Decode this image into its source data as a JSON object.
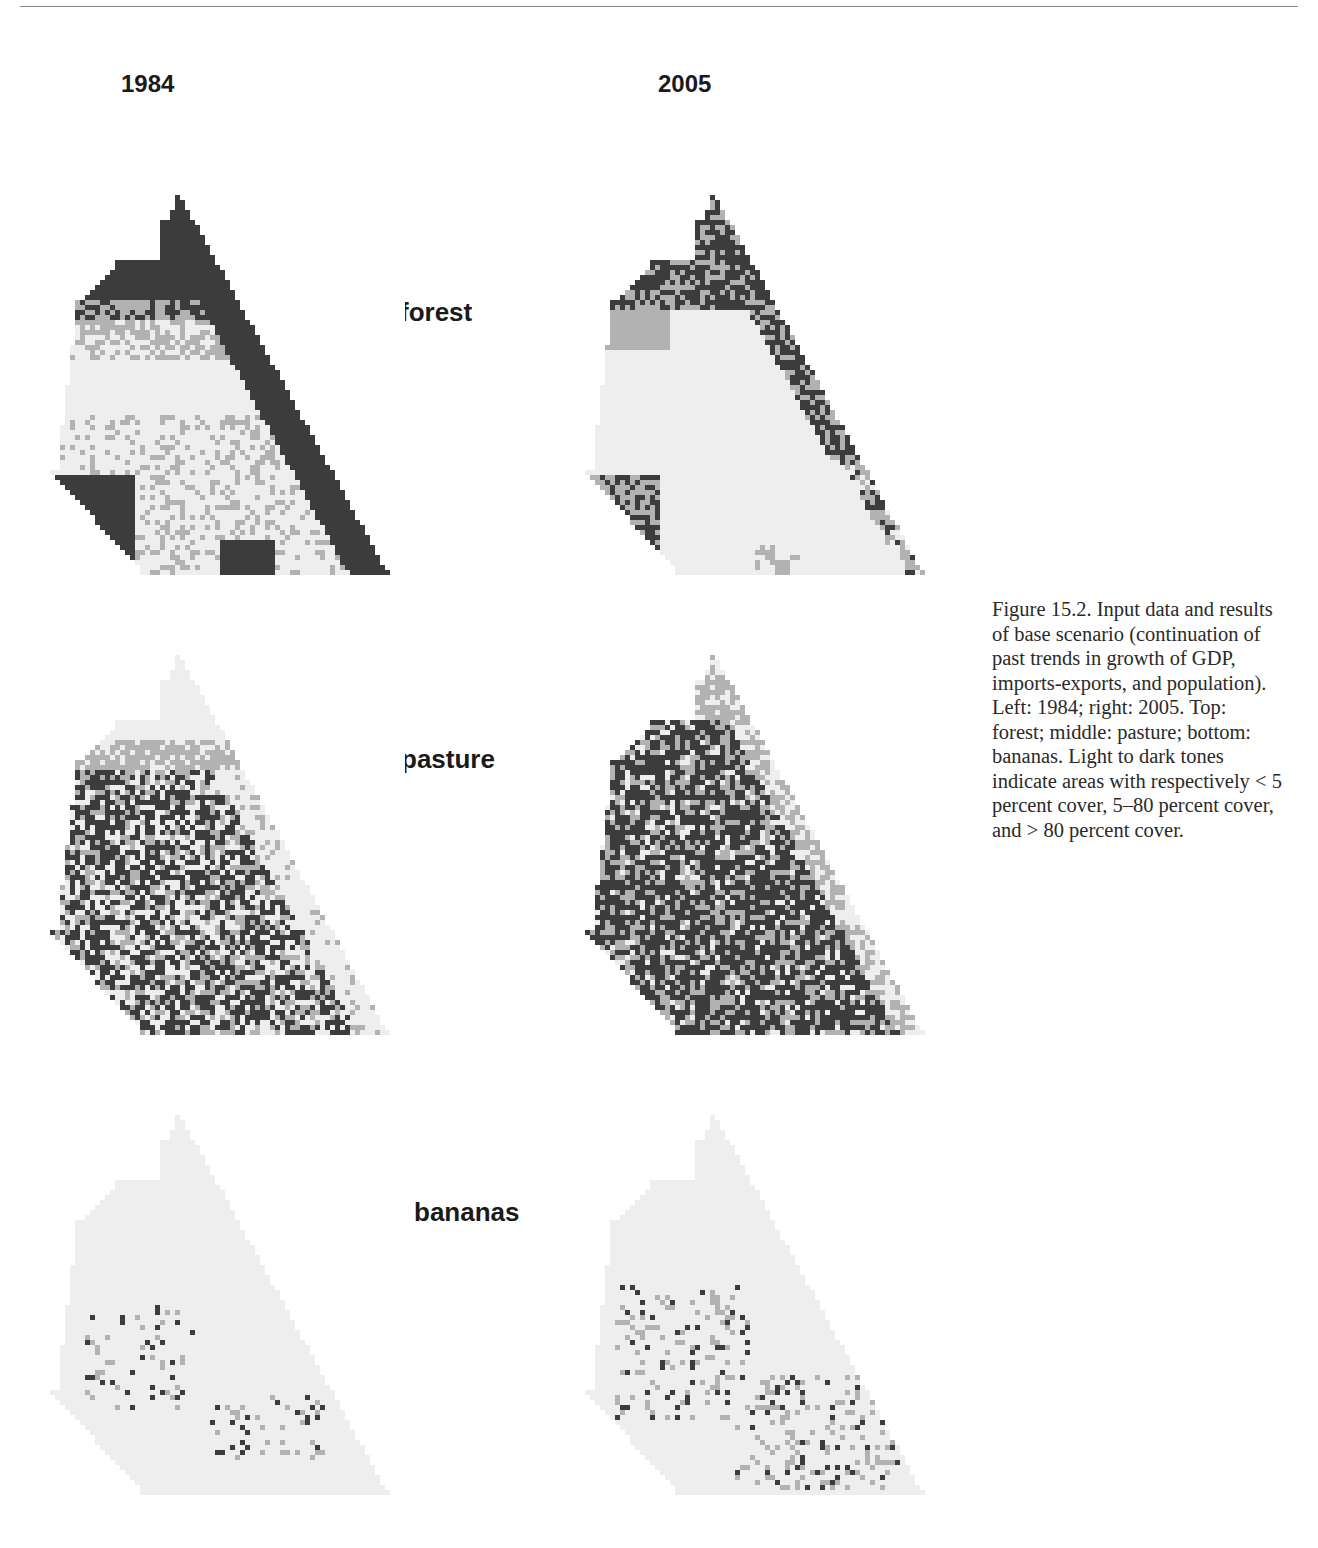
{
  "figure": {
    "column_headers": [
      "1984",
      "2005"
    ],
    "row_labels": [
      "forest",
      "pasture",
      "bananas"
    ],
    "caption": "Figure 15.2. Input data and results of base scenario (continuation of past trends in growth of GDP, imports-exports, and population). Left: 1984; right: 2005. Top: forest; middle: pasture; bottom: bananas. Light to dark tones indicate areas with respectively < 5 percent cover, 5–80 percent cover, and > 80 percent cover.",
    "legend": {
      "classes": [
        {
          "label": "< 5 percent cover",
          "color": "#eeeeee"
        },
        {
          "label": "5–80 percent cover",
          "color": "#b2b2b2"
        },
        {
          "label": "> 80 percent cover",
          "color": "#3c3c3c"
        }
      ]
    },
    "maps": [
      {
        "id": "forest-1984",
        "variable": "forest",
        "year": "1984",
        "pattern": "forest_1984"
      },
      {
        "id": "forest-2005",
        "variable": "forest",
        "year": "2005",
        "pattern": "forest_2005"
      },
      {
        "id": "pasture-1984",
        "variable": "pasture",
        "year": "1984",
        "pattern": "pasture_1984"
      },
      {
        "id": "pasture-2005",
        "variable": "pasture",
        "year": "2005",
        "pattern": "pasture_2005"
      },
      {
        "id": "bananas-1984",
        "variable": "bananas",
        "year": "1984",
        "pattern": "bananas_1984"
      },
      {
        "id": "bananas-2005",
        "variable": "bananas",
        "year": "2005",
        "pattern": "bananas_2005"
      }
    ]
  }
}
